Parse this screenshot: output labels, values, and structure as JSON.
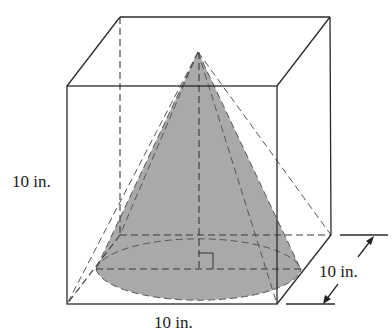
{
  "figure": {
    "labels": {
      "height": "10 in.",
      "width": "10 in.",
      "depth": "10 in."
    },
    "colors": {
      "cone_fill": "#a9a9a9",
      "line": "#2a2a2a",
      "background": "#ffffff"
    }
  }
}
